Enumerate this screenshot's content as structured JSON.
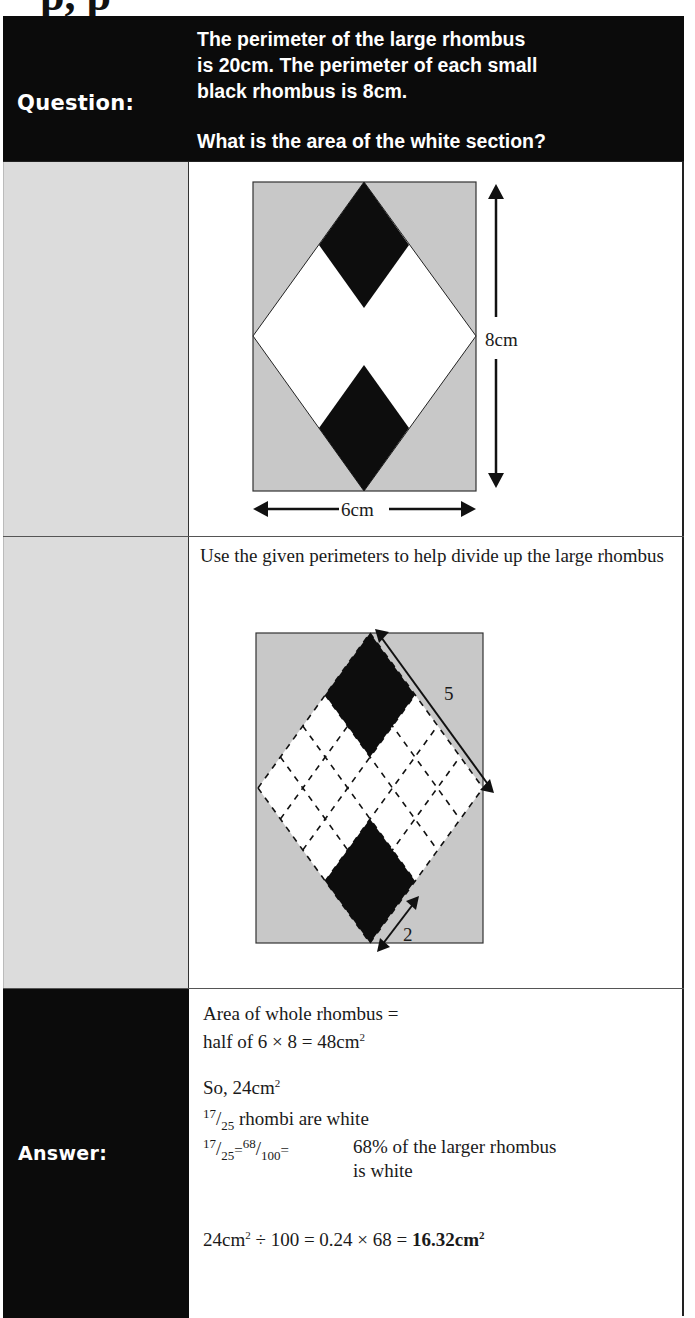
{
  "heading_fragment": "p, p",
  "header": {
    "label": "Question:",
    "question_lines": [
      "The perimeter of the large rhombus",
      "is 20cm. The perimeter of each small",
      "black rhombus is 8cm."
    ],
    "question_prompt": "What is the area of the white section?"
  },
  "diagram1": {
    "height_label": "8cm",
    "width_label": "6cm",
    "colors": {
      "background": "#c8c8c8",
      "black": "#0d0d0d",
      "white": "#ffffff"
    }
  },
  "hint": {
    "text": "Use the given perimeters to help divide up the large rhombus",
    "side_label": "5",
    "small_side_label": "2"
  },
  "answer": {
    "label": "Answer:",
    "line1": "Area of whole rhombus =",
    "line2_prefix": "half of 6 × 8 = 48cm",
    "line2_sup": "2",
    "line3_prefix": "So, 24cm",
    "line3_sup": "2",
    "line4": {
      "num": "17",
      "den": "25",
      "text": "rhombi are white"
    },
    "line5": {
      "num1": "17",
      "den1": "25",
      "eq1": "=",
      "num2": "68",
      "den2": "100",
      "eq2": "=",
      "text_a": "68% of the larger rhombus",
      "text_b": "is white"
    },
    "line6": {
      "a": "24cm",
      "a_sup": "2",
      "b": " ÷ 100 = 0.24 × 68 = ",
      "result": "16.32cm",
      "result_sup": "2"
    }
  }
}
